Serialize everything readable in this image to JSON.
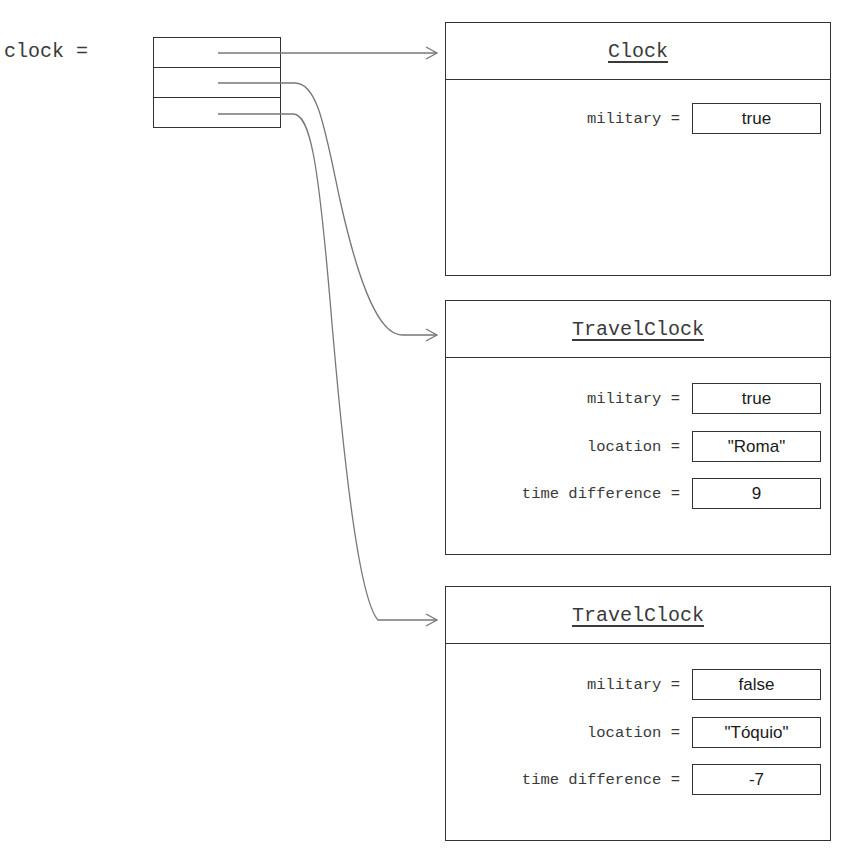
{
  "variable": {
    "label": "clock ="
  },
  "array": {
    "cells": 3
  },
  "objects": [
    {
      "class_name": "Clock",
      "fields": [
        {
          "name": "military =",
          "value": "true"
        }
      ]
    },
    {
      "class_name": "TravelClock",
      "fields": [
        {
          "name": "military =",
          "value": "true"
        },
        {
          "name": "location =",
          "value": "\"Roma\""
        },
        {
          "name": "time difference =",
          "value": "9"
        }
      ]
    },
    {
      "class_name": "TravelClock",
      "fields": [
        {
          "name": "military =",
          "value": "false"
        },
        {
          "name": "location =",
          "value": "\"Tóquio\""
        },
        {
          "name": "time difference =",
          "value": "-7"
        }
      ]
    }
  ],
  "colors": {
    "line": "#333333",
    "arrow": "#777777",
    "background": "#ffffff"
  }
}
